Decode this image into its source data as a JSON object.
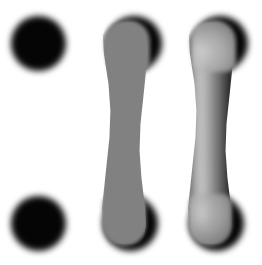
{
  "figure": {
    "background_color": "#ffffff",
    "width": 262,
    "height": 265
  },
  "panels": [
    {
      "id": "endpoints",
      "label": "Endpoints only",
      "description": "Two solid black circular endpoints with no connecting body",
      "elements": [
        {
          "name": "top endpoint",
          "shape": "circle",
          "fill": "#050505",
          "cx": 38,
          "cy": 44,
          "r": 27
        },
        {
          "name": "bottom endpoint",
          "shape": "circle",
          "fill": "#050505",
          "cx": 38,
          "cy": 224,
          "r": 27
        }
      ]
    },
    {
      "id": "flat",
      "label": "Flat shading",
      "description": "Curved grey band joining the two black endpoints, filled with a single flat grey tone",
      "elements": [
        {
          "name": "top endpoint",
          "shape": "circle",
          "fill": "#050505",
          "cx": 128,
          "cy": 44,
          "r": 27
        },
        {
          "name": "bottom endpoint",
          "shape": "circle",
          "fill": "#050505",
          "cx": 124,
          "cy": 224,
          "r": 27
        },
        {
          "name": "connecting band",
          "shape": "curved-capsule",
          "fill": "#818181",
          "width": 47
        }
      ]
    },
    {
      "id": "shaded",
      "label": "Smooth 3D shading",
      "description": "Same curved band rendered as a cylinder with a specular highlight on the left and dark falloff on the right",
      "elements": [
        {
          "name": "top endpoint",
          "shape": "circle",
          "fill": "#050505",
          "cx": 214,
          "cy": 44,
          "r": 27
        },
        {
          "name": "bottom endpoint",
          "shape": "circle",
          "fill": "#050505",
          "cx": 210,
          "cy": 224,
          "r": 27
        },
        {
          "name": "connecting band",
          "shape": "curved-capsule",
          "fill": "gradient",
          "width": 47
        }
      ],
      "gradient_stops": [
        "#5a5a5a",
        "#9a9a9a",
        "#b4b4b4",
        "#9e9e9e",
        "#6e6e6e",
        "#3a3a3a",
        "#141414"
      ],
      "highlight_color": "#ffffff"
    }
  ],
  "colors": {
    "background": "#ffffff",
    "endpoint": "#050505",
    "flat_band": "#818181",
    "highlight": "#b4b4b4",
    "shadow": "#141414"
  }
}
